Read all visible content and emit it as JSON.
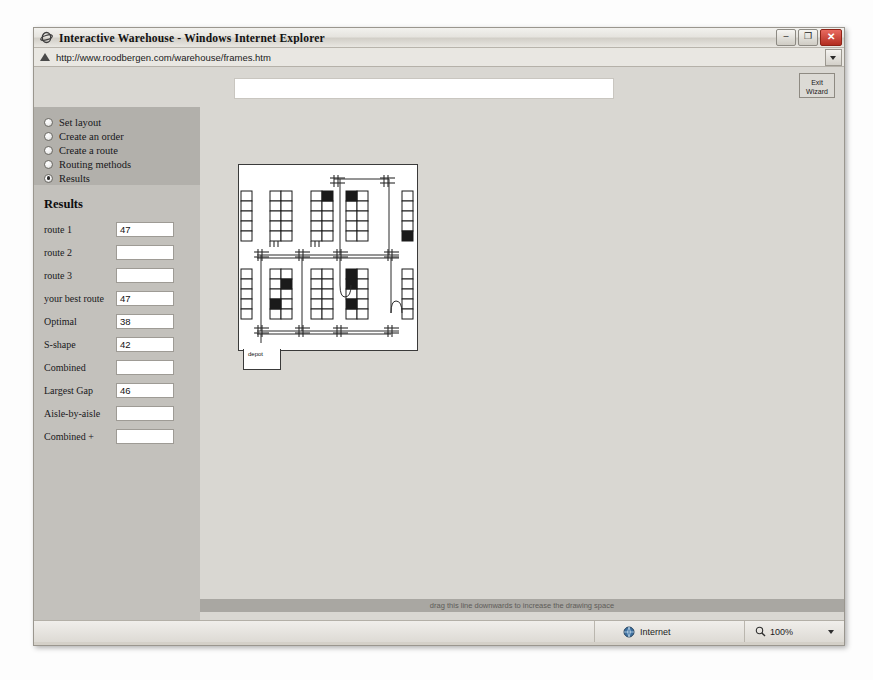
{
  "window": {
    "title": "Interactive Warehouse - Windows Internet Explorer",
    "minimize_label": "–",
    "restore_label": "❐",
    "close_label": "✕"
  },
  "address": {
    "url": "http://www.roodbergen.com/warehouse/frames.htm",
    "icon": "page-icon",
    "dropdown_icon": "chevron-down-icon"
  },
  "toolbar": {
    "banner_value": "",
    "exit_wizard_line1": "Exit",
    "exit_wizard_line2": "Wizard"
  },
  "sidebar": {
    "items": [
      {
        "label": "Set layout",
        "selected": false
      },
      {
        "label": "Create an order",
        "selected": false
      },
      {
        "label": "Create a route",
        "selected": false
      },
      {
        "label": "Routing methods",
        "selected": false
      },
      {
        "label": "Results",
        "selected": true
      }
    ]
  },
  "results": {
    "title": "Results",
    "rows": [
      {
        "label": "route 1",
        "value": "47"
      },
      {
        "label": "route 2",
        "value": ""
      },
      {
        "label": "route 3",
        "value": ""
      },
      {
        "label": "your best route",
        "value": "47"
      },
      {
        "label": "Optimal",
        "value": "38"
      },
      {
        "label": "S-shape",
        "value": "42"
      },
      {
        "label": "Combined",
        "value": ""
      },
      {
        "label": "Largest Gap",
        "value": "46"
      },
      {
        "label": "Aisle-by-aisle",
        "value": ""
      },
      {
        "label": "Combined +",
        "value": ""
      }
    ]
  },
  "drawing": {
    "depot_label": "depot",
    "drag_hint": "drag this line downwards to increase the drawing space"
  },
  "statusbar": {
    "zone_label": "Internet",
    "zone_icon": "globe-icon",
    "zoom_label": "100%",
    "zoom_icon": "magnifier-icon",
    "zoom_caret_icon": "chevron-down-icon"
  },
  "colors": {
    "window_chrome": "#d4d0c8",
    "page_background": "#d9d7d2",
    "nav_block": "#b2b0ab",
    "sidebar": "#c3c1bc",
    "close_button": "#b32d20",
    "pick_location": "#1a1a1a"
  }
}
